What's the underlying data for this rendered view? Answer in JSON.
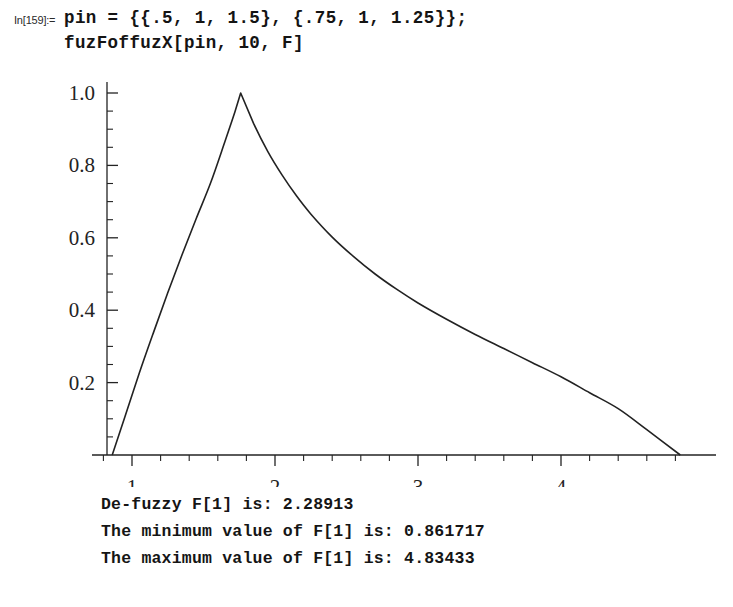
{
  "notebook": {
    "input": {
      "prompt_label": "In[159]:=",
      "code_lines": [
        "pin = {{.5, 1, 1.5}, {.75, 1, 1.25}};",
        "fuzFoffuzX[pin, 10, F]"
      ]
    },
    "output_lines": [
      "De-fuzzy F[1] is: 2.28913",
      "The minimum value of F[1] is: 0.861717",
      "The maximum value of F[1] is: 4.83433"
    ]
  },
  "chart_data": {
    "type": "line",
    "title": "",
    "xlabel": "",
    "ylabel": "",
    "xlim": [
      0.78,
      4.98
    ],
    "ylim": [
      0.0,
      1.04
    ],
    "grid": false,
    "legend": null,
    "x_ticks": [
      1,
      2,
      3,
      4
    ],
    "x_tick_labels": [
      "1",
      "2",
      "3",
      "4"
    ],
    "x_minor_tick_step": 0.2,
    "y_ticks": [
      0.2,
      0.4,
      0.6,
      0.8,
      1.0
    ],
    "y_tick_labels": [
      "0.2",
      "0.4",
      "0.6",
      "0.8",
      "1.0"
    ],
    "y_minor_tick_step": 0.05,
    "line_color": "#222222",
    "line_width": 1.6,
    "annotations": {
      "defuzzy_value": 2.28913,
      "minimum_value": 0.861717,
      "maximum_value": 4.83433,
      "peak_x": 1.76,
      "peak_y": 1.0
    },
    "series": [
      {
        "name": "F[1] membership",
        "x": [
          0.8617,
          0.95,
          1.05,
          1.15,
          1.25,
          1.35,
          1.45,
          1.55,
          1.65,
          1.72,
          1.76,
          1.85,
          1.95,
          2.05,
          2.15,
          2.25,
          2.4,
          2.55,
          2.7,
          2.85,
          3.0,
          3.2,
          3.4,
          3.6,
          3.8,
          4.0,
          4.2,
          4.4,
          4.6,
          4.8343
        ],
        "y": [
          0.0,
          0.105,
          0.225,
          0.338,
          0.448,
          0.553,
          0.654,
          0.752,
          0.866,
          0.948,
          1.0,
          0.916,
          0.838,
          0.773,
          0.716,
          0.666,
          0.602,
          0.548,
          0.5,
          0.458,
          0.42,
          0.375,
          0.333,
          0.294,
          0.255,
          0.216,
          0.172,
          0.128,
          0.07,
          0.0
        ]
      }
    ]
  }
}
